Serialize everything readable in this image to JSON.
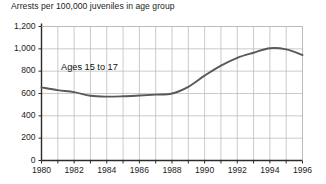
{
  "chart_data": {
    "type": "line",
    "title": "Arrests per 100,000 juveniles in age group",
    "xlabel": "",
    "ylabel": "",
    "xlim": [
      1980,
      1996
    ],
    "ylim": [
      0,
      1200
    ],
    "grid": true,
    "legend_position": "inline-annotation",
    "y_ticks": [
      0,
      200,
      400,
      600,
      800,
      1000,
      1200
    ],
    "y_tick_labels": [
      "0",
      "200",
      "400",
      "600",
      "800",
      "1,000",
      "1,200"
    ],
    "x_ticks": [
      1980,
      1981,
      1982,
      1983,
      1984,
      1985,
      1986,
      1987,
      1988,
      1989,
      1990,
      1991,
      1992,
      1993,
      1994,
      1995,
      1996
    ],
    "x_tick_labels": [
      "1980",
      "",
      "1982",
      "",
      "1984",
      "",
      "1986",
      "",
      "1988",
      "",
      "1990",
      "",
      "1992",
      "",
      "1994",
      "",
      "1996"
    ],
    "x_major_labels": [
      "1980",
      "1982",
      "1984",
      "1986",
      "1988",
      "1990",
      "1992",
      "1994",
      "1996"
    ],
    "line_color": "#595959",
    "grid_color": "#b4b4b4",
    "axis_color": "#2b2b2b",
    "annotations": [
      {
        "text": "Ages 15 to 17",
        "x": 1981.2,
        "y": 830
      }
    ],
    "series": [
      {
        "name": "Ages 15 to 17",
        "x": [
          1980,
          1981,
          1982,
          1983,
          1984,
          1985,
          1986,
          1987,
          1988,
          1989,
          1990,
          1991,
          1992,
          1993,
          1994,
          1995,
          1996
        ],
        "values": [
          655,
          630,
          612,
          580,
          572,
          575,
          582,
          590,
          600,
          660,
          760,
          850,
          920,
          965,
          1005,
          995,
          945
        ]
      }
    ]
  }
}
